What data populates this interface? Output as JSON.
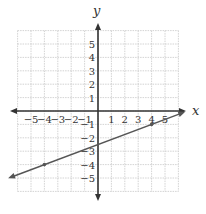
{
  "chart_data": {
    "type": "line",
    "title": "",
    "xlabel": "x",
    "ylabel": "y",
    "xlim": [
      -6,
      6
    ],
    "ylim": [
      -6,
      6
    ],
    "grid": true,
    "x_ticks": [
      -5,
      -4,
      -3,
      -2,
      -1,
      1,
      2,
      3,
      4,
      5
    ],
    "y_ticks": [
      5,
      4,
      3,
      2,
      1,
      -1,
      -2,
      -3,
      -4,
      -5
    ],
    "x_tick_labels": [
      "−5",
      "−4",
      "−3",
      "−2",
      "−1",
      "1",
      "2",
      "3",
      "4",
      "5"
    ],
    "y_tick_labels": [
      "5",
      "4",
      "3",
      "2",
      "1",
      "−1",
      "−2",
      "−3",
      "−4",
      "−5"
    ],
    "series": [
      {
        "name": "line",
        "slope": 0.375,
        "intercept": -2.5,
        "x": [
          -6.5,
          6.3
        ],
        "y": [
          -4.94,
          -0.14
        ],
        "marked_points": [
          {
            "x": -4,
            "y": -4
          },
          {
            "x": 4,
            "y": -1
          }
        ],
        "arrows": "right"
      }
    ]
  },
  "colors": {
    "grid": "#c8c8c8",
    "axis": "#333333",
    "line": "#555555",
    "text": "#333333"
  }
}
